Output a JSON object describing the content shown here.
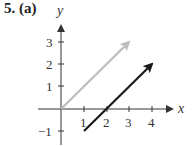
{
  "problem_label": "5. (a)",
  "axes": {
    "x_label": "x",
    "y_label": "y",
    "x_ticks": [
      "1",
      "2",
      "3",
      "4"
    ],
    "y_ticks": [
      "-1",
      "1",
      "2",
      "3"
    ]
  },
  "vectors": [
    {
      "name": "gray-vector",
      "from": [
        0,
        0
      ],
      "to": [
        3,
        3
      ],
      "color": "#bdbdbd"
    },
    {
      "name": "black-vector",
      "from": [
        1,
        -1
      ],
      "to": [
        4,
        2
      ],
      "color": "#1a1a1a"
    }
  ]
}
